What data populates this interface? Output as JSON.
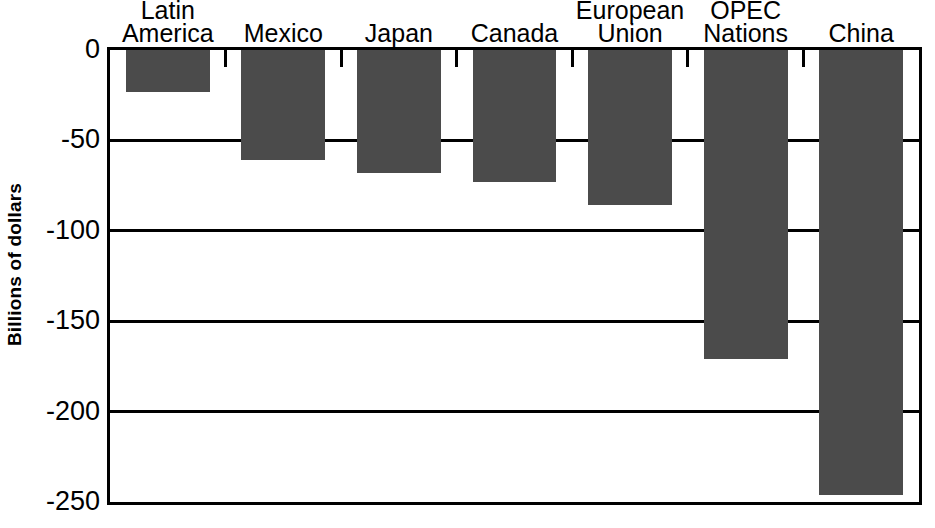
{
  "chart_data": {
    "type": "bar",
    "title": "",
    "xlabel": "",
    "ylabel": "Billions of dollars",
    "categories": [
      "Latin\nAmerica",
      "Mexico",
      "Japan",
      "Canada",
      "European\nUnion",
      "OPEC\nNations",
      "China"
    ],
    "values": [
      -23,
      -61,
      -68,
      -73,
      -86,
      -171,
      -246
    ],
    "ylim": [
      -250,
      0
    ],
    "ytick_labels": [
      "0",
      "-50",
      "-100",
      "-150",
      "-200",
      "-250"
    ],
    "yticks": [
      0,
      -50,
      -100,
      -150,
      -200,
      -250
    ],
    "grid": true,
    "legend": "none",
    "bar_color": "#4b4b4b",
    "axis_color": "#000000",
    "background_color": "#ffffff"
  },
  "axis": {
    "y_title": "Billions of dollars"
  }
}
